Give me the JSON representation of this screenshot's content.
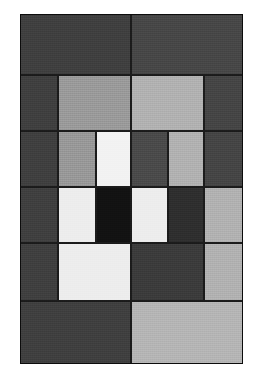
{
  "artwork": {
    "title": "Grayscale Geometric Grid Composition",
    "medium": "abstract rectangular block grid",
    "canvas": {
      "width": 256,
      "height": 381,
      "background_color": "#ffffff"
    },
    "frame": {
      "left": 20,
      "top": 14,
      "right": 243,
      "bottom": 364,
      "width": 223,
      "height": 350,
      "grout_color": "#1b1b1b",
      "grout_width": 1
    },
    "palette": {
      "near_black": "#121212",
      "very_dark_gray": "#2e2e2e",
      "dark_gray": "#3f3f3f",
      "dark_gray_alt": "#474747",
      "mid_dark_gray": "#4f4f4f",
      "medium_gray": "#9a9a9a",
      "light_gray": "#b1b1b1",
      "lighter_gray": "#bdbdbd",
      "off_white": "#ededed",
      "white": "#f2f2f2"
    },
    "grid": {
      "column_edges": [
        20,
        58,
        96,
        131,
        168,
        204,
        243
      ],
      "row_edges": [
        14,
        75,
        131,
        187,
        243,
        301,
        364
      ],
      "columns": 6,
      "rows": 6
    },
    "bands": [
      {
        "name": "band-1-top",
        "top": 14,
        "bottom": 75,
        "cells": [
          {
            "name": "cell-1-1",
            "x": 20,
            "w": 111,
            "color": "#3f3f3f",
            "tone": "dark gray"
          },
          {
            "name": "cell-1-2",
            "x": 131,
            "w": 112,
            "color": "#474747",
            "tone": "dark gray"
          }
        ]
      },
      {
        "name": "band-2",
        "top": 75,
        "bottom": 131,
        "cells": [
          {
            "name": "cell-2-1",
            "x": 20,
            "w": 38,
            "color": "#3f3f3f",
            "tone": "dark gray"
          },
          {
            "name": "cell-2-2",
            "x": 58,
            "w": 73,
            "color": "#9a9a9a",
            "tone": "medium gray"
          },
          {
            "name": "cell-2-3",
            "x": 131,
            "w": 73,
            "color": "#b1b1b1",
            "tone": "light gray"
          },
          {
            "name": "cell-2-4",
            "x": 204,
            "w": 39,
            "color": "#454545",
            "tone": "dark gray"
          }
        ]
      },
      {
        "name": "band-3",
        "top": 131,
        "bottom": 187,
        "cells": [
          {
            "name": "cell-3-1",
            "x": 20,
            "w": 38,
            "color": "#3f3f3f",
            "tone": "dark gray"
          },
          {
            "name": "cell-3-2",
            "x": 58,
            "w": 38,
            "color": "#989898",
            "tone": "medium gray"
          },
          {
            "name": "cell-3-3",
            "x": 96,
            "w": 35,
            "color": "#f2f2f2",
            "tone": "white"
          },
          {
            "name": "cell-3-4",
            "x": 131,
            "w": 37,
            "color": "#4a4a4a",
            "tone": "dark gray"
          },
          {
            "name": "cell-3-5",
            "x": 168,
            "w": 36,
            "color": "#b1b1b1",
            "tone": "light gray"
          },
          {
            "name": "cell-3-6",
            "x": 204,
            "w": 39,
            "color": "#454545",
            "tone": "dark gray"
          }
        ]
      },
      {
        "name": "band-4",
        "top": 187,
        "bottom": 243,
        "cells": [
          {
            "name": "cell-4-1",
            "x": 20,
            "w": 38,
            "color": "#3f3f3f",
            "tone": "dark gray"
          },
          {
            "name": "cell-4-2",
            "x": 58,
            "w": 38,
            "color": "#ededed",
            "tone": "white"
          },
          {
            "name": "cell-4-3",
            "x": 96,
            "w": 35,
            "color": "#121212",
            "tone": "near black"
          },
          {
            "name": "cell-4-4",
            "x": 131,
            "w": 37,
            "color": "#ededed",
            "tone": "white"
          },
          {
            "name": "cell-4-5",
            "x": 168,
            "w": 36,
            "color": "#2e2e2e",
            "tone": "very dark gray"
          },
          {
            "name": "cell-4-6",
            "x": 204,
            "w": 39,
            "color": "#b1b1b1",
            "tone": "light gray"
          }
        ]
      },
      {
        "name": "band-5",
        "top": 243,
        "bottom": 301,
        "cells": [
          {
            "name": "cell-5-1",
            "x": 20,
            "w": 38,
            "color": "#3f3f3f",
            "tone": "dark gray"
          },
          {
            "name": "cell-5-2",
            "x": 58,
            "w": 73,
            "color": "#ededed",
            "tone": "white"
          },
          {
            "name": "cell-5-3",
            "x": 131,
            "w": 73,
            "color": "#3b3b3b",
            "tone": "dark gray"
          },
          {
            "name": "cell-5-4",
            "x": 204,
            "w": 39,
            "color": "#b1b1b1",
            "tone": "light gray"
          }
        ]
      },
      {
        "name": "band-6-bottom",
        "top": 301,
        "bottom": 364,
        "cells": [
          {
            "name": "cell-6-1",
            "x": 20,
            "w": 111,
            "color": "#3f3f3f",
            "tone": "dark gray"
          },
          {
            "name": "cell-6-2",
            "x": 131,
            "w": 112,
            "color": "#b5b5b5",
            "tone": "light gray"
          }
        ]
      }
    ]
  }
}
